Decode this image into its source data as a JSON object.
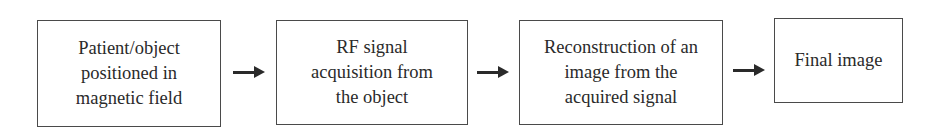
{
  "diagram": {
    "type": "flowchart",
    "direction": "left-to-right",
    "nodes": [
      {
        "id": "n1",
        "label": "Patient/object\npositioned in\nmagnetic field"
      },
      {
        "id": "n2",
        "label": "RF signal\nacquisition from\nthe object"
      },
      {
        "id": "n3",
        "label": "Reconstruction of an\nimage from the\nacquired signal"
      },
      {
        "id": "n4",
        "label": "Final image"
      }
    ],
    "edges": [
      {
        "from": "n1",
        "to": "n2"
      },
      {
        "from": "n2",
        "to": "n3"
      },
      {
        "from": "n3",
        "to": "n4"
      }
    ],
    "colors": {
      "border": "#4a4a4a",
      "text": "#2a2a2a",
      "arrow": "#2a2a2a",
      "background": "#ffffff"
    }
  }
}
